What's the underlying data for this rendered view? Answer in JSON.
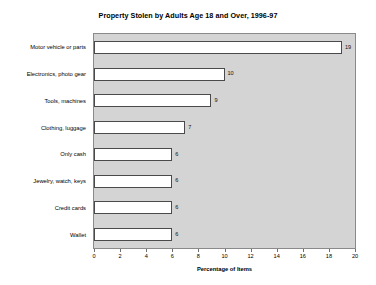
{
  "chart_data": {
    "type": "bar",
    "orientation": "horizontal",
    "title": "Property Stolen by Adults Age 18 and Over, 1996-97",
    "xlabel": "Percentage of Items",
    "ylabel": "",
    "categories": [
      "Motor vehicle or parts",
      "Electronics, photo gear",
      "Tools, machines",
      "Clothing, luggage",
      "Only cash",
      "Jewelry, watch, keys",
      "Credit cards",
      "Wallet"
    ],
    "values": [
      19,
      10,
      9,
      7,
      6,
      6,
      6,
      6
    ],
    "data_labels": [
      "19",
      "10",
      "9",
      "7",
      "6",
      "6",
      "6",
      "6"
    ],
    "xlim": [
      0,
      20
    ],
    "xticks": [
      0,
      2,
      4,
      6,
      8,
      10,
      12,
      14,
      16,
      18,
      20
    ],
    "xtick_labels": [
      "0",
      "2",
      "4",
      "6",
      "8",
      "10",
      "12",
      "14",
      "16",
      "18",
      "20"
    ],
    "grid": false,
    "legend": null,
    "colors": {
      "bar_fill": "#ffffff",
      "bar_edge": "#4a4a4a",
      "plot_background": "#d4d4d4",
      "plot_border": "#8a8a8a",
      "figure_background": "#ffffff",
      "text": "#000000"
    }
  }
}
